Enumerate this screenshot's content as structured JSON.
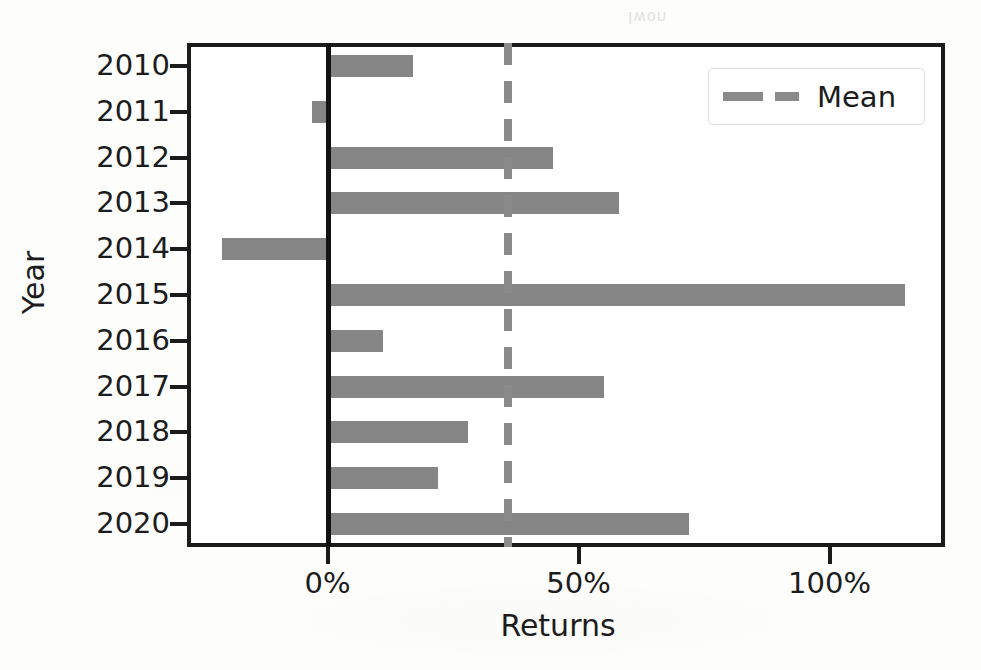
{
  "chart_data": {
    "type": "bar",
    "orientation": "horizontal",
    "title": "",
    "xlabel": "Returns",
    "ylabel": "Year",
    "categories": [
      "2010",
      "2011",
      "2012",
      "2013",
      "2014",
      "2015",
      "2016",
      "2017",
      "2018",
      "2019",
      "2020"
    ],
    "values": [
      17,
      -3,
      45,
      58,
      -21,
      115,
      11,
      55,
      28,
      22,
      72
    ],
    "value_unit": "%",
    "xlim": [
      -28,
      123
    ],
    "xticks": [
      0,
      50,
      100
    ],
    "xtick_labels": [
      "0%",
      "50%",
      "100%"
    ],
    "grid": false,
    "bar_color": "#858585",
    "annotations": [
      {
        "name": "mean-line",
        "type": "vline",
        "value": 36,
        "style": "dashed",
        "color": "#8a8a8a"
      },
      {
        "name": "zero-line",
        "type": "vline",
        "value": 0,
        "style": "solid",
        "color": "#121212"
      }
    ],
    "legend": {
      "position": "upper right",
      "entries": [
        {
          "label": "Mean",
          "marker": "dashed-line",
          "color": "#8a8a8a"
        }
      ]
    }
  },
  "legend": {
    "mean_label": "Mean"
  },
  "axes": {
    "x_title": "Returns",
    "y_title": "Year"
  },
  "artifact": {
    "bleed_text": "Iwon"
  }
}
